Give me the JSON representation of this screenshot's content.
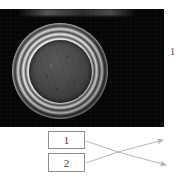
{
  "figure": {
    "type": "annotated-photograph",
    "photo": {
      "alt_name": "circular-specimen-photograph",
      "background_color": "#050505",
      "subject": "circular dish with concentric bright rings and dark centre"
    },
    "edge_label": {
      "text": "1"
    },
    "callouts": [
      {
        "id": "callout-1",
        "label": "1"
      },
      {
        "id": "callout-2",
        "label": "2"
      }
    ],
    "leader_lines": [
      {
        "from": "callout-1",
        "color": "#b5b5b5",
        "direction": "right-down"
      },
      {
        "from": "callout-2",
        "color": "#b5b5b5",
        "direction": "right-up"
      }
    ]
  }
}
